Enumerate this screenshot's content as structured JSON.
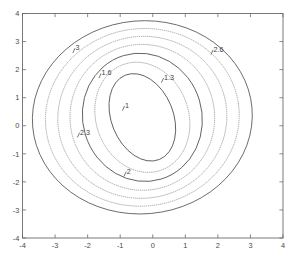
{
  "figure": {
    "background_color": "#ffffff",
    "width": 295,
    "height": 259
  },
  "caption": {
    "text": ""
  },
  "chart_data": {
    "type": "line",
    "subtype": "contour",
    "title": "",
    "subtitle": "",
    "xlabel": "",
    "ylabel": "",
    "xlim": [
      -4,
      4
    ],
    "ylim": [
      -4,
      4
    ],
    "grid": false,
    "legend": null,
    "legend_position": "none",
    "x_ticks": [
      -4,
      -3,
      -2,
      -1,
      0,
      1,
      2,
      3,
      4
    ],
    "x_tick_labels": [
      "-4",
      "-3",
      "-2",
      "-1",
      "0",
      "1",
      "2",
      "3",
      "4"
    ],
    "y_ticks": [
      -4,
      -3,
      -2,
      -1,
      0,
      1,
      2,
      3,
      4
    ],
    "y_tick_labels": [
      "-4",
      "-3",
      "-2",
      "-1",
      "0",
      "1",
      "2",
      "3",
      "4"
    ],
    "center": [
      -0.32,
      0.3
    ],
    "contour_levels": [
      1,
      1.3,
      1.6,
      2,
      2.3,
      2.6,
      3
    ],
    "contours": [
      {
        "level": 1,
        "label": "1",
        "line_style": "solid",
        "rx": 0.95,
        "ry": 1.62,
        "rotation_deg": 22,
        "label_x": -0.9,
        "label_y": 0.62
      },
      {
        "level": 1.3,
        "label": "1.3",
        "line_style": "dotted",
        "rx": 1.42,
        "ry": 2.0,
        "rotation_deg": 20,
        "label_x": 0.3,
        "label_y": 1.62
      },
      {
        "level": 1.6,
        "label": "1.6",
        "line_style": "solid",
        "rx": 1.83,
        "ry": 2.3,
        "rotation_deg": 17,
        "label_x": -1.62,
        "label_y": 1.78
      },
      {
        "level": 2,
        "label": "2",
        "line_style": "dotted",
        "rx": 2.22,
        "ry": 2.6,
        "rotation_deg": 14,
        "label_x": -0.85,
        "label_y": -1.72
      },
      {
        "level": 2.3,
        "label": "2.3",
        "line_style": "dotted",
        "rx": 2.6,
        "ry": 2.88,
        "rotation_deg": 11,
        "label_x": -2.28,
        "label_y": -0.33
      },
      {
        "level": 2.6,
        "label": "2.6",
        "line_style": "dotted",
        "rx": 2.98,
        "ry": 3.16,
        "rotation_deg": 8,
        "label_x": 1.82,
        "label_y": 2.62
      },
      {
        "level": 3,
        "label": "3",
        "line_style": "solid",
        "rx": 3.38,
        "ry": 3.44,
        "rotation_deg": 5,
        "label_x": -2.42,
        "label_y": 2.68
      }
    ],
    "colors": {
      "solid_contour": "#585858",
      "dotted_contour": "#9a9a9a",
      "axis": "#6b6b6b",
      "tick_label": "#4a4a4a",
      "contour_label": "#3d3d3d"
    }
  }
}
